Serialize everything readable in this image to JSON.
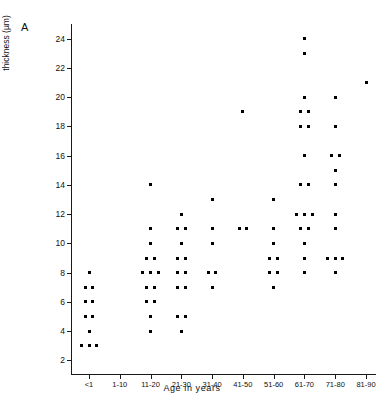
{
  "figure": {
    "panel_letter": "A",
    "corner_mark": "",
    "ylabel_line1": "Mean Capsule",
    "ylabel_line2": "thickness (µm)",
    "xlabel": "Age in years"
  },
  "chart_data": {
    "type": "scatter",
    "title": "",
    "xlabel": "Age in years",
    "ylabel": "Mean Capsule thickness (µm)",
    "grid": false,
    "legend": null,
    "categories": [
      "<1",
      "1-10",
      "11-20",
      "21-30",
      "31-40",
      "41-50",
      "51-60",
      "61-70",
      "71-80",
      "81-90"
    ],
    "xtick_labels": [
      "<1",
      "1-10",
      "11-20",
      "21-30",
      "31-40",
      "41-50",
      "51-60",
      "61-70",
      "71-80",
      "81-90"
    ],
    "ytick_labels": [
      "2",
      "4",
      "6",
      "8",
      "10",
      "12",
      "14",
      "16",
      "18",
      "20",
      "22",
      "24"
    ],
    "ytick_values": [
      2,
      4,
      6,
      8,
      10,
      12,
      14,
      16,
      18,
      20,
      22,
      24
    ],
    "ylim": [
      1,
      25
    ],
    "marker": "square",
    "marker_color": "#000000",
    "groups": [
      {
        "category": "<1",
        "values": [
          8,
          7,
          7,
          6,
          6,
          5,
          5,
          4,
          3,
          3,
          3
        ]
      },
      {
        "category": "1-10",
        "values": []
      },
      {
        "category": "11-20",
        "values": [
          14,
          11,
          10,
          9,
          9,
          8,
          8,
          8,
          7,
          7,
          6,
          6,
          5,
          4
        ]
      },
      {
        "category": "21-30",
        "values": [
          12,
          11,
          11,
          10,
          9,
          9,
          8,
          8,
          7,
          7,
          5,
          5,
          4
        ]
      },
      {
        "category": "31-40",
        "values": [
          13,
          11,
          10,
          8,
          8,
          7
        ]
      },
      {
        "category": "41-50",
        "values": [
          19,
          11,
          11
        ]
      },
      {
        "category": "51-60",
        "values": [
          13,
          11,
          10,
          9,
          9,
          8,
          8,
          7
        ]
      },
      {
        "category": "61-70",
        "values": [
          24,
          23,
          20,
          19,
          19,
          18,
          18,
          16,
          14,
          14,
          12,
          12,
          12,
          11,
          11,
          10,
          9,
          8
        ]
      },
      {
        "category": "71-80",
        "values": [
          20,
          18,
          16,
          16,
          15,
          14,
          12,
          11,
          9,
          9,
          9,
          8
        ]
      },
      {
        "category": "81-90",
        "values": [
          21
        ]
      }
    ]
  }
}
